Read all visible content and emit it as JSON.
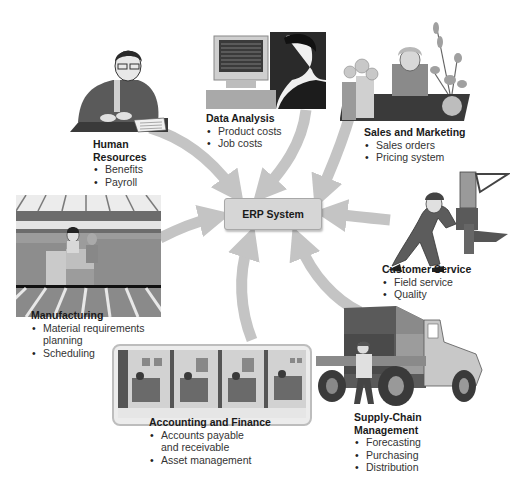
{
  "diagram": {
    "center": {
      "label": "ERP System"
    },
    "nodes": [
      {
        "id": "human-resources",
        "title_lines": [
          "Human",
          "Resources"
        ],
        "items": [
          "Benefits",
          "Payroll"
        ],
        "illustration": "person-at-desk-writing"
      },
      {
        "id": "data-analysis",
        "title_lines": [
          "Data Analysis"
        ],
        "items": [
          "Product costs",
          "Job costs"
        ],
        "illustration": "person-at-computer"
      },
      {
        "id": "sales-and-marketing",
        "title_lines": [
          "Sales and Marketing"
        ],
        "items": [
          "Sales orders",
          "Pricing system"
        ],
        "illustration": "florist-with-flowers"
      },
      {
        "id": "customer-service",
        "title_lines": [
          "Customer Service"
        ],
        "items": [
          "Field service",
          "Quality"
        ],
        "illustration": "technician-repairing-machine"
      },
      {
        "id": "supply-chain-management",
        "title_lines": [
          "Supply-Chain",
          "Management"
        ],
        "items": [
          "Forecasting",
          "Purchasing",
          "Distribution"
        ],
        "illustration": "delivery-truck-with-driver"
      },
      {
        "id": "accounting-and-finance",
        "title_lines": [
          "Accounting and Finance"
        ],
        "items": [
          "Accounts payable and receivable",
          "Asset management"
        ],
        "item_lines": [
          [
            "Accounts payable",
            "and receivable"
          ],
          [
            "Asset management"
          ]
        ],
        "illustration": "office-cubicles"
      },
      {
        "id": "manufacturing",
        "title_lines": [
          "Manufacturing"
        ],
        "items": [
          "Material requirements planning",
          "Scheduling"
        ],
        "item_lines": [
          [
            "Material requirements",
            "planning"
          ],
          [
            "Scheduling"
          ]
        ],
        "illustration": "factory-floor"
      }
    ],
    "colors": {
      "arrow": "#c4c4c4",
      "center_fill": "#d6d6d6",
      "center_border": "#a8a8a8",
      "text": "#333333"
    }
  }
}
